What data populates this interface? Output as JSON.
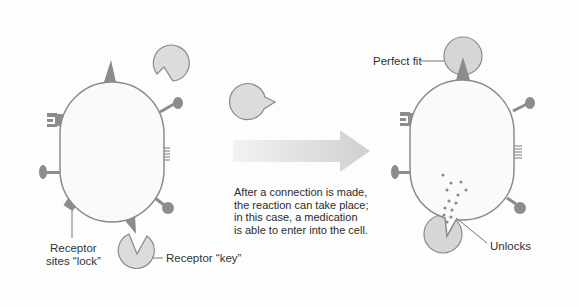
{
  "diagram": {
    "labels": {
      "receptor_sites_line1": "Receptor",
      "receptor_sites_line2": "sites “lock”",
      "receptor_key": "Receptor “key”",
      "perfect_fit": "Perfect fit",
      "unlocks": "Unlocks"
    },
    "caption": {
      "lines": [
        "After a connection is made,",
        "the reaction can take place;",
        "in this case, a medication",
        "is able to enter into the cell."
      ]
    },
    "colors": {
      "cell_fill": "#fafafa",
      "cell_stroke": "#8a8a8a",
      "receptor_dark": "#8c8c8c",
      "key_fill": "#dadada",
      "key_stroke": "#8a8a8a",
      "arrow_light": "#f0f0f0",
      "arrow_dark": "#d0d0d0",
      "text": "#333333"
    },
    "stages": [
      {
        "name": "before",
        "description": "cell with receptor sites and free keys"
      },
      {
        "name": "after",
        "description": "key bound to receptor, medication enters cell"
      }
    ]
  }
}
